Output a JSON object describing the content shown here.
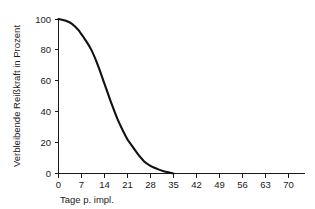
{
  "chart_data": {
    "type": "line",
    "title": "",
    "subtitle": "",
    "xlabel": "Tage p. impl.",
    "ylabel": "Verbleibende Reißkraft in Prozent",
    "xlim": [
      0,
      73
    ],
    "ylim": [
      0,
      100
    ],
    "grid": false,
    "legend": null,
    "legend_position": "none",
    "line_color": "#111111",
    "axis_color": "#1a1a1a",
    "background_color": "#ffffff",
    "xticks": [
      0,
      7,
      14,
      21,
      28,
      35,
      42,
      49,
      56,
      63,
      70
    ],
    "xtick_labels": [
      "0",
      "7",
      "14",
      "21",
      "28",
      "35",
      "42",
      "49",
      "56",
      "63",
      "70"
    ],
    "yticks": [
      0,
      20,
      40,
      60,
      80,
      100
    ],
    "ytick_labels": [
      "0",
      "20",
      "40",
      "60",
      "80",
      "100"
    ],
    "series": [
      {
        "name": "Verbleibende Reißkraft",
        "x": [
          0,
          2,
          4,
          6,
          7,
          8,
          10,
          12,
          14,
          15,
          16,
          18,
          20,
          21,
          22,
          24,
          26,
          28,
          30,
          32,
          34,
          35
        ],
        "values": [
          100,
          99,
          97,
          93,
          90,
          87,
          80,
          70,
          58,
          52,
          46,
          35,
          26,
          22,
          19,
          13,
          8,
          5,
          3,
          1.5,
          0.5,
          0
        ]
      }
    ],
    "annotations": []
  }
}
